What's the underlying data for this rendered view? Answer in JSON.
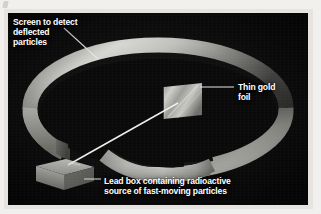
{
  "figure": {
    "name": "rutherford-gold-foil-experiment",
    "background_color": "#0d0d0d",
    "plate_border_color": "#e7e4e0",
    "label_color": "#ffffff",
    "beam_color": "#e8e8e6",
    "ring_color_light": "#cfcfcb",
    "ring_color_dark": "#4a4a48",
    "foil_color": "#b9b9b5",
    "leadbox_color": "#c2c2bd"
  },
  "labels": {
    "screen": {
      "name": "screen-label",
      "lines": [
        "Screen to detect",
        "deflected",
        "particles"
      ],
      "line1": "Screen to detect",
      "line2": "deflected",
      "line3": "particles"
    },
    "foil": {
      "name": "gold-foil-label",
      "lines": [
        "Thin gold",
        "foil"
      ],
      "line1": "Thin gold",
      "line2": "foil"
    },
    "leadbox": {
      "name": "lead-box-label",
      "lines": [
        "Lead box containing radioactive",
        "source of fast-moving particles"
      ],
      "line1": "Lead box containing radioactive",
      "line2": "source of fast-moving particles"
    }
  },
  "parts": {
    "detector_screen": "circular detector screen ring",
    "gold_foil": "thin gold foil square target",
    "lead_box": "lead box radioactive source",
    "particle_beam": "beam of fast-moving alpha particles"
  }
}
